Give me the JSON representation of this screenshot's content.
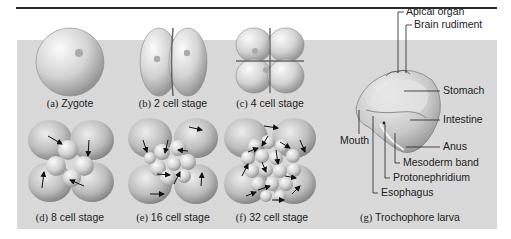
{
  "figure": {
    "panels": [
      {
        "id": "a",
        "letter": "(a)",
        "title": "Zygote"
      },
      {
        "id": "b",
        "letter": "(b)",
        "title": "2 cell stage"
      },
      {
        "id": "c",
        "letter": "(c)",
        "title": "4 cell stage"
      },
      {
        "id": "d",
        "letter": "(d)",
        "title": "8 cell stage"
      },
      {
        "id": "e",
        "letter": "(e)",
        "title": "16 cell stage"
      },
      {
        "id": "f",
        "letter": "(f)",
        "title": "32 cell stage"
      },
      {
        "id": "g",
        "letter": "(g)",
        "title": "Trochophore larva"
      }
    ],
    "larva_labels": {
      "apical_organ": "Apical organ",
      "brain_rudiment": "Brain rudiment",
      "stomach": "Stomach",
      "intestine": "Intestine",
      "anus": "Anus",
      "mesoderm_band": "Mesoderm band",
      "protonephridium": "Protonephridium",
      "esophagus": "Esophagus",
      "mouth": "Mouth"
    },
    "colors": {
      "panel_bg": "#d9d9d9",
      "cell_light": "#f2f2f2",
      "cell_dark": "#9a9a9a",
      "line": "#222222"
    }
  }
}
